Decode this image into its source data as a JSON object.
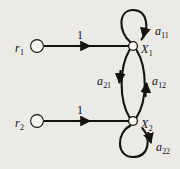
{
  "figure": {
    "type": "signal-flow-graph",
    "background_color": "#ebeae7",
    "ink_color": "#15130f",
    "width": 180,
    "height": 169
  },
  "nodes": [
    {
      "id": "r1",
      "label_base": "r",
      "label_sub": "1",
      "x": 37,
      "y": 46,
      "radius": 6.5,
      "style": "open-circle"
    },
    {
      "id": "r2",
      "label_base": "r",
      "label_sub": "2",
      "x": 37,
      "y": 121,
      "radius": 6.5,
      "style": "open-circle"
    },
    {
      "id": "x1",
      "label_base": "X",
      "label_sub": "1",
      "x": 133,
      "y": 46,
      "radius": 4.5,
      "style": "open-circle"
    },
    {
      "id": "x2",
      "label_base": "X",
      "label_sub": "2",
      "x": 133,
      "y": 121,
      "radius": 4.5,
      "style": "open-circle"
    }
  ],
  "edges": [
    {
      "id": "r1-x1",
      "from": "r1",
      "to": "x1",
      "shape": "straight",
      "label_base": "1",
      "label_sub": ""
    },
    {
      "id": "r2-x2",
      "from": "r2",
      "to": "x2",
      "shape": "straight",
      "label_base": "1",
      "label_sub": ""
    },
    {
      "id": "x1-x1",
      "from": "x1",
      "to": "x1",
      "shape": "self-loop-above",
      "label_base": "a",
      "label_sub": "11"
    },
    {
      "id": "x2-x2",
      "from": "x2",
      "to": "x2",
      "shape": "self-loop-below",
      "label_base": "a",
      "label_sub": "22"
    },
    {
      "id": "x1-x2",
      "from": "x1",
      "to": "x2",
      "shape": "curve-left-down",
      "label_base": "a",
      "label_sub": "21"
    },
    {
      "id": "x2-x1",
      "from": "x2",
      "to": "x1",
      "shape": "curve-right-up",
      "label_base": "a",
      "label_sub": "12"
    }
  ],
  "labels": {
    "r1": {
      "base": "r",
      "sub": "1"
    },
    "r2": {
      "base": "r",
      "sub": "2"
    },
    "x1": {
      "base": "X",
      "sub": "1"
    },
    "x2": {
      "base": "X",
      "sub": "2"
    },
    "a11": {
      "base": "a",
      "sub": "11"
    },
    "a22": {
      "base": "a",
      "sub": "22"
    },
    "a21": {
      "base": "a",
      "sub": "21"
    },
    "a12": {
      "base": "a",
      "sub": "12"
    },
    "w1": {
      "base": "1",
      "sub": ""
    },
    "w2": {
      "base": "1",
      "sub": ""
    }
  }
}
